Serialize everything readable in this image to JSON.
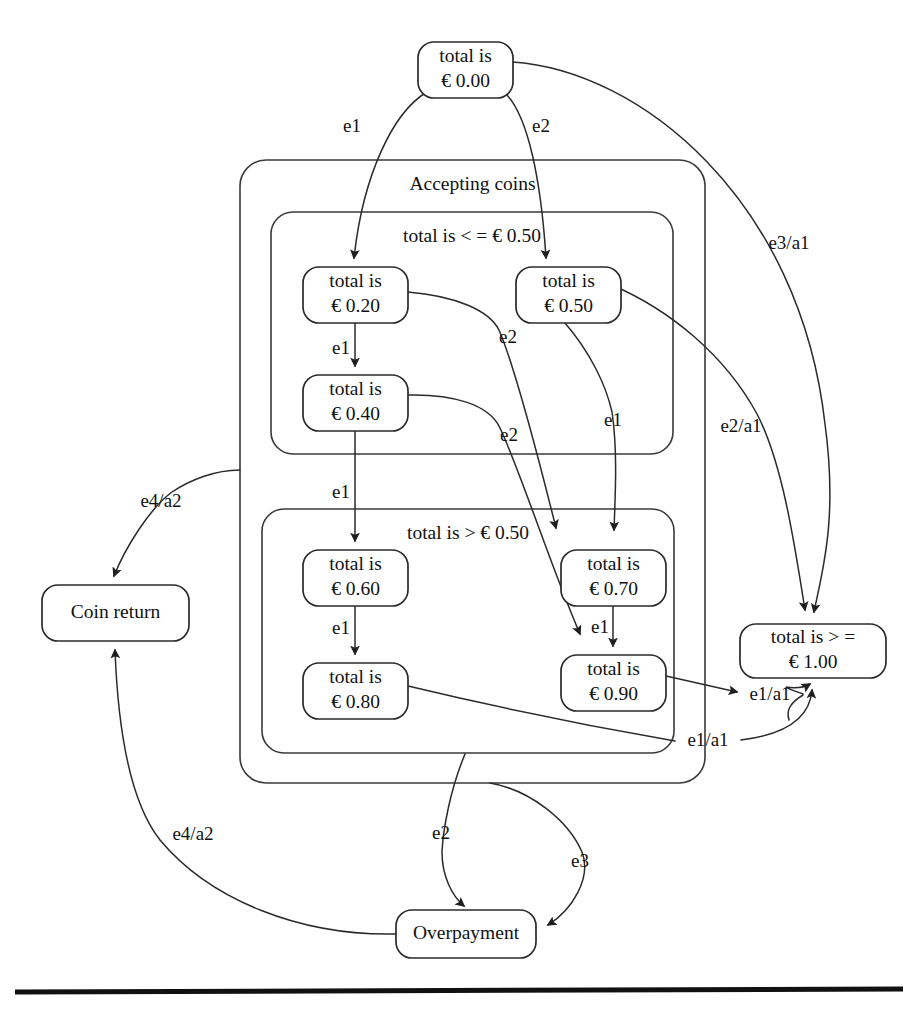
{
  "diagram": {
    "colors": {
      "background": "#ffffff",
      "stroke": "#2b2b2b",
      "region_stroke": "#3a3a3a",
      "text": "#111111",
      "rule": "#111111"
    },
    "regions": [
      {
        "id": "accepting",
        "label": "Accepting coins",
        "x": 240,
        "y": 160,
        "w": 465,
        "h": 623,
        "r": 26
      },
      {
        "id": "le050",
        "label": "total is < = € 0.50",
        "x": 271,
        "y": 212,
        "w": 402,
        "h": 242,
        "r": 22
      },
      {
        "id": "gt050",
        "label": "total is > € 0.50",
        "x": 262,
        "y": 509,
        "w": 412,
        "h": 244,
        "r": 22
      }
    ],
    "states": [
      {
        "id": "s000",
        "line1": "total is",
        "line2": "€ 0.00",
        "x": 418,
        "y": 42,
        "w": 95,
        "h": 56
      },
      {
        "id": "s020",
        "line1": "total is",
        "line2": "€ 0.20",
        "x": 303,
        "y": 267,
        "w": 105,
        "h": 56
      },
      {
        "id": "s050",
        "line1": "total is",
        "line2": "€ 0.50",
        "x": 516,
        "y": 267,
        "w": 105,
        "h": 56
      },
      {
        "id": "s040",
        "line1": "total is",
        "line2": "€ 0.40",
        "x": 303,
        "y": 375,
        "w": 105,
        "h": 56
      },
      {
        "id": "s060",
        "line1": "total is",
        "line2": "€ 0.60",
        "x": 303,
        "y": 550,
        "w": 105,
        "h": 56
      },
      {
        "id": "s070",
        "line1": "total is",
        "line2": "€ 0.70",
        "x": 561,
        "y": 550,
        "w": 105,
        "h": 56
      },
      {
        "id": "s080",
        "line1": "total is",
        "line2": "€ 0.80",
        "x": 303,
        "y": 663,
        "w": 105,
        "h": 56
      },
      {
        "id": "s090",
        "line1": "total is",
        "line2": "€ 0.90",
        "x": 561,
        "y": 655,
        "w": 105,
        "h": 56
      },
      {
        "id": "s100",
        "line1": "total is > =",
        "line2": "€ 1.00",
        "x": 740,
        "y": 624,
        "w": 146,
        "h": 54
      },
      {
        "id": "coinreturn",
        "line1": "Coin return",
        "line2": "",
        "x": 42,
        "y": 585,
        "w": 147,
        "h": 56
      },
      {
        "id": "overpayment",
        "line1": "Overpayment",
        "line2": "",
        "x": 396,
        "y": 910,
        "w": 140,
        "h": 48
      }
    ],
    "edges": [
      {
        "id": "e-000-020",
        "from": "s000",
        "to": "s020",
        "label": "e1",
        "label_x": 352,
        "label_y": 128
      },
      {
        "id": "e-000-050",
        "from": "s000",
        "to": "s050",
        "label": "e2",
        "label_x": 541,
        "label_y": 128
      },
      {
        "id": "e-000-100",
        "from": "s000",
        "to": "s100",
        "label": "e3/a1",
        "label_x": 789,
        "label_y": 245
      },
      {
        "id": "e-020-040",
        "from": "s020",
        "to": "s040",
        "label": "e1",
        "label_x": 341,
        "label_y": 350
      },
      {
        "id": "e-020-070",
        "from": "s020",
        "to": "s070",
        "label": "e2",
        "label_x": 508,
        "label_y": 339
      },
      {
        "id": "e-040-090",
        "from": "s040",
        "to": "s090",
        "label": "e2",
        "label_x": 509,
        "label_y": 437
      },
      {
        "id": "e-040-060",
        "from": "s040",
        "to": "s060",
        "label": "e1",
        "label_x": 341,
        "label_y": 494
      },
      {
        "id": "e-050-070",
        "from": "s050",
        "to": "s070",
        "label": "e1",
        "label_x": 613,
        "label_y": 422
      },
      {
        "id": "e-050-100",
        "from": "s050",
        "to": "s100",
        "label": "e2/a1",
        "label_x": 741,
        "label_y": 428
      },
      {
        "id": "e-060-080",
        "from": "s060",
        "to": "s080",
        "label": "e1",
        "label_x": 341,
        "label_y": 630
      },
      {
        "id": "e-070-090",
        "from": "s070",
        "to": "s090",
        "label": "e1",
        "label_x": 600,
        "label_y": 629
      },
      {
        "id": "e-090-100",
        "from": "s090",
        "to": "s100",
        "label": "e1/a1",
        "label_x": 770,
        "label_y": 696
      },
      {
        "id": "e-080-100",
        "from": "s080",
        "to": "s100",
        "label": "e1/a1",
        "label_x": 708,
        "label_y": 742
      },
      {
        "id": "e-accepting-coinreturn",
        "from": "accepting",
        "to": "coinreturn",
        "label": "e4/a2",
        "label_x": 161,
        "label_y": 503
      },
      {
        "id": "e-overpayment-coinreturn",
        "from": "overpayment",
        "to": "coinreturn",
        "label": "e4/a2",
        "label_x": 193,
        "label_y": 836
      },
      {
        "id": "e-accepting-overpayment",
        "from": "accepting",
        "to": "overpayment",
        "label": "e2",
        "label_x": 441,
        "label_y": 835
      },
      {
        "id": "e-gt050-overpayment",
        "from": "gt050",
        "to": "overpayment",
        "label": "e3",
        "label_x": 580,
        "label_y": 863
      }
    ],
    "rule": {
      "x1": 15,
      "y1": 992,
      "x2": 903,
      "y2": 989
    }
  }
}
